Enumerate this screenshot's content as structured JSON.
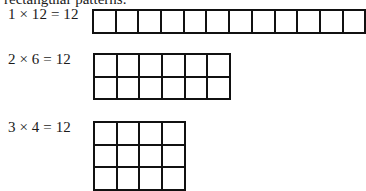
{
  "intro_fragment": "rectangular patterns.",
  "arrays": [
    {
      "label": "1 × 12 = 12",
      "rows": 1,
      "cols": 12,
      "top": 9,
      "label_top": 6
    },
    {
      "label": "2 × 6 = 12",
      "rows": 2,
      "cols": 6,
      "top": 53,
      "label_top": 51
    },
    {
      "label": "3 × 4 = 12",
      "rows": 3,
      "cols": 4,
      "top": 121,
      "label_top": 119
    }
  ],
  "colors": {
    "line": "#111111",
    "text": "#1a1a1a",
    "background": "#ffffff"
  }
}
